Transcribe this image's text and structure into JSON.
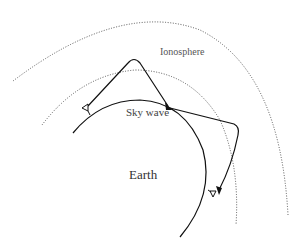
{
  "diagram": {
    "labels": {
      "ionosphere": "Ionosphere",
      "sky_wave": "Sky wave",
      "earth": "Earth"
    },
    "elements": {
      "outer_ionosphere_layer": "dotted arc",
      "inner_ionosphere_layer": "dotted arc",
      "earth_surface": "solid arc",
      "transmitter": "antenna on left of earth surface",
      "receivers": [
        "antenna on right side of earth surface"
      ],
      "paths": [
        {
          "from": "transmitter",
          "to": "hop point",
          "via": "reflection at ionosphere peak"
        },
        {
          "from": "hop point",
          "to": "receiver",
          "via": "reflection at outer ionosphere"
        }
      ]
    },
    "colors": {
      "line": "#111111",
      "dotted": "#555555",
      "background": "#ffffff"
    }
  }
}
